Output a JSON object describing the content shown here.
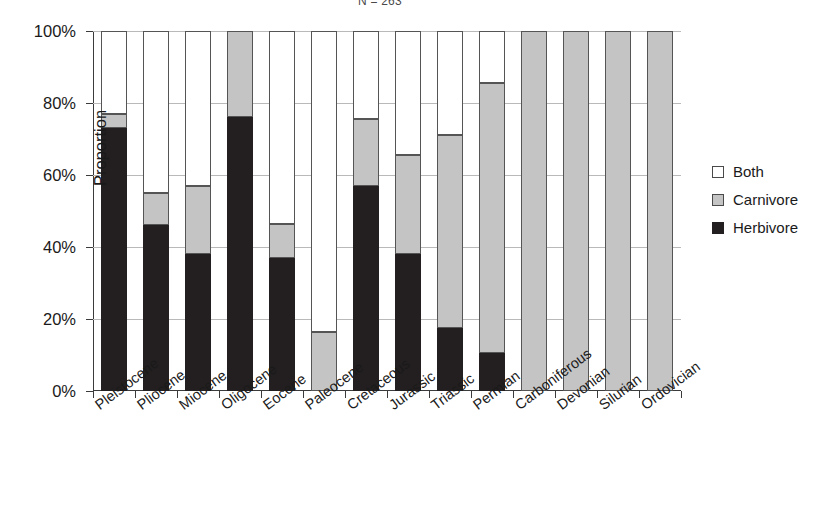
{
  "chart_data": {
    "type": "bar",
    "subtype": "stacked-100-percent",
    "title": "N = 263",
    "xlabel": "",
    "ylabel": "Proportion",
    "ylim": [
      0,
      100
    ],
    "yticks": [
      "0%",
      "20%",
      "40%",
      "60%",
      "80%",
      "100%"
    ],
    "ytick_values": [
      0,
      20,
      40,
      60,
      80,
      100
    ],
    "grid": "horizontal",
    "legend_position": "right",
    "categories": [
      "Pleistocene",
      "Pliocene",
      "Miocene",
      "Oligocene",
      "Eocene",
      "Paleocene",
      "Cretaceous",
      "Jurassic",
      "Triassic",
      "Permian",
      "Carboniferous",
      "Devonian",
      "Silurian",
      "Ordovician"
    ],
    "series": [
      {
        "name": "Herbivore",
        "color": "#231f20",
        "values": [
          73,
          46,
          38,
          76,
          37,
          0,
          57,
          38,
          17.5,
          10.5,
          0,
          0,
          0,
          0
        ]
      },
      {
        "name": "Carnivore",
        "color": "#c4c4c4",
        "values": [
          4,
          9,
          19,
          24,
          9.5,
          16.5,
          18.5,
          27.5,
          53.5,
          75,
          100,
          100,
          100,
          100
        ]
      },
      {
        "name": "Both",
        "color": "#ffffff",
        "values": [
          23,
          45,
          43,
          0,
          53.5,
          83.5,
          24.5,
          34.5,
          29,
          14.5,
          0,
          0,
          0,
          0
        ]
      }
    ],
    "cumulative_tops": {
      "herbivore": [
        73,
        46,
        38,
        76,
        37,
        0,
        57,
        38,
        17.5,
        10.5,
        0,
        0,
        0,
        0
      ],
      "carnivore": [
        77,
        55,
        57,
        100,
        46.5,
        16.5,
        75.5,
        65.5,
        71,
        85.5,
        100,
        100,
        100,
        100
      ]
    }
  },
  "legend": {
    "entries": [
      {
        "label": "Both",
        "swatch": "white-square-icon"
      },
      {
        "label": "Carnivore",
        "swatch": "gray-square-icon"
      },
      {
        "label": "Herbivore",
        "swatch": "black-square-icon"
      }
    ]
  }
}
